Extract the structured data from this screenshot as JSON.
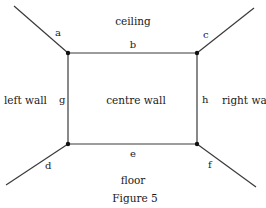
{
  "figure": {
    "caption": "Figure 5",
    "regions": {
      "ceiling": "ceiling",
      "left_wall": "left wall",
      "centre_wall": "centre wall",
      "right_wall": "right wall",
      "floor": "floor"
    },
    "edges": {
      "a": "a",
      "b": "b",
      "c": "c",
      "d": "d",
      "e": "e",
      "f": "f",
      "g": "g",
      "h": "h"
    },
    "line_color": "#3a3a3a",
    "vertex_color": "#111111"
  }
}
